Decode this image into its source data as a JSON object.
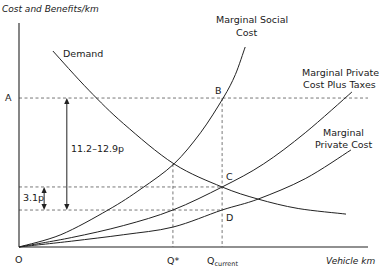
{
  "chart_data": {
    "type": "line",
    "title": "",
    "ylabel": "Cost and Benefits/km",
    "xlabel": "Vehicle km",
    "origin_label": "O",
    "xlim": [
      0,
      100
    ],
    "ylim": [
      0,
      100
    ],
    "grid": false,
    "x_markers": [
      {
        "id": "qstar",
        "label": "Q*",
        "sub": "",
        "x": 44.1
      },
      {
        "id": "qcurrent",
        "label": "Q",
        "sub": "current",
        "x": 58.2
      }
    ],
    "y_markers": [
      {
        "id": "A",
        "label": "A",
        "y": 66.5
      }
    ],
    "series": [
      {
        "name": "Marginal Social Cost",
        "label_lines": [
          "Marginal Social",
          "Cost"
        ],
        "points": [
          [
            0,
            0
          ],
          [
            12,
            5.5
          ],
          [
            25.5,
            16.5
          ],
          [
            35,
            26
          ],
          [
            44.4,
            37.1
          ],
          [
            52,
            51
          ],
          [
            58.5,
            66.5
          ],
          [
            62,
            77
          ],
          [
            64.8,
            89.3
          ]
        ]
      },
      {
        "name": "Marginal Private Cost Plus Taxes",
        "label_lines": [
          "Marginal Private",
          "Cost Plus Taxes"
        ],
        "points": [
          [
            0,
            0
          ],
          [
            15,
            4.2
          ],
          [
            30,
            9.6
          ],
          [
            44.1,
            16.5
          ],
          [
            58.2,
            26.8
          ],
          [
            70,
            37
          ],
          [
            82,
            51
          ],
          [
            95.4,
            69.2
          ]
        ]
      },
      {
        "name": "Marginal Private Cost",
        "label_lines": [
          "Marginal",
          "Private Cost"
        ],
        "points": [
          [
            0,
            0
          ],
          [
            15,
            2.6
          ],
          [
            30,
            5.5
          ],
          [
            44.1,
            8.9
          ],
          [
            58.2,
            16.5
          ],
          [
            68.5,
            21.4
          ],
          [
            82,
            30.5
          ],
          [
            95.1,
            43.3
          ]
        ]
      },
      {
        "name": "Demand",
        "label_lines": [
          "Demand"
        ],
        "points": [
          [
            9.7,
            87.5
          ],
          [
            20,
            70
          ],
          [
            30,
            55
          ],
          [
            44.4,
            37.1
          ],
          [
            58.2,
            26.8
          ],
          [
            68.5,
            21.4
          ],
          [
            80,
            17.2
          ],
          [
            93.7,
            14.7
          ]
        ]
      }
    ],
    "points": [
      {
        "label": "B",
        "x": 58.2,
        "y": 66.5
      },
      {
        "label": "C",
        "x": 58.2,
        "y": 26.8
      },
      {
        "label": "D",
        "x": 58.2,
        "y": 16.5
      }
    ],
    "h_guides": [
      {
        "y": 66.5,
        "x_to": 100
      },
      {
        "y": 26.8,
        "x_to": 58.2
      },
      {
        "y": 16.5,
        "x_to": 58.2
      }
    ],
    "annotations": [
      {
        "text": "11.2–12.9p",
        "from_y": 66.5,
        "to_y": 16.5,
        "x": 13.7
      },
      {
        "text": "3.1p",
        "from_y": 26.8,
        "to_y": 16.5,
        "x": 7.2
      }
    ]
  }
}
